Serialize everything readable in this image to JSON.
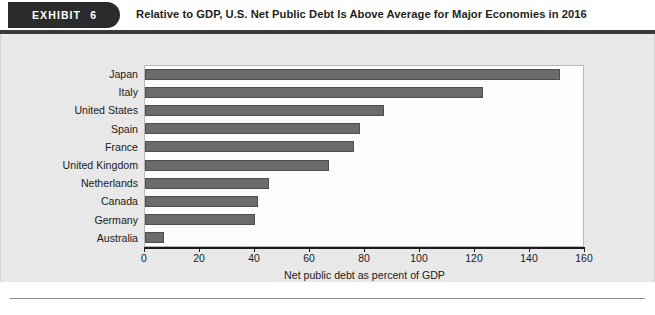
{
  "exhibit": {
    "tab_label": "EXHIBIT",
    "tab_number": "6",
    "title": "Relative to GDP, U.S. Net Public Debt Is Above Average for Major Economies in 2016"
  },
  "colors": {
    "tab_background": "#2b2b2b",
    "bar_fill": "#6b6b6b",
    "bar_stroke": "#4f4f4f",
    "mat_background": "#e8e8e8",
    "plot_background": "#fdfdfd",
    "axis": "#1a1a1a"
  },
  "chart_data": {
    "type": "bar",
    "orientation": "horizontal",
    "title": "Relative to GDP, U.S. Net Public Debt Is Above Average for Major Economies in 2016",
    "categories": [
      "Japan",
      "Italy",
      "United States",
      "Spain",
      "France",
      "United Kingdom",
      "Netherlands",
      "Canada",
      "Germany",
      "Australia"
    ],
    "values": [
      151,
      123,
      87,
      78,
      76,
      67,
      45,
      41,
      40,
      7
    ],
    "xlabel": "Net public debt as percent of GDP",
    "ylabel": "",
    "xlim": [
      0,
      160
    ],
    "xticks": [
      0,
      20,
      40,
      60,
      80,
      100,
      120,
      140,
      160
    ],
    "xtick_labels": [
      "0",
      "20",
      "40",
      "60",
      "80",
      "100",
      "120",
      "140",
      "160"
    ],
    "grid": false,
    "legend": null
  }
}
